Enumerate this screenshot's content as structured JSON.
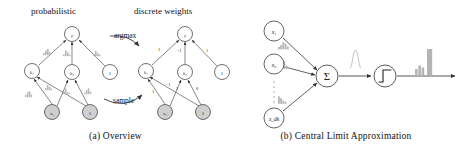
{
  "figure": {
    "panels": [
      {
        "id": "overview",
        "caption": "(a) Overview",
        "headings": {
          "left": "probabilistic",
          "right": "discrete weights"
        },
        "transition_labels": {
          "top": "argmax",
          "bottom": "sample"
        },
        "left_graph": {
          "nodes": [
            {
              "id": "top",
              "label": "y",
              "shaded": false,
              "cx": 72,
              "cy": 34,
              "r": 7.5
            },
            {
              "id": "mid-left",
              "label": "h₁",
              "shaded": false,
              "cx": 32,
              "cy": 71,
              "r": 7.5
            },
            {
              "id": "mid-center",
              "label": "h₂",
              "shaded": false,
              "cx": 72,
              "cy": 72,
              "r": 7.5
            },
            {
              "id": "mid-right",
              "label": "1",
              "shaded": false,
              "cx": 110,
              "cy": 72,
              "r": 7.5
            },
            {
              "id": "bottom-left",
              "label": "x₁",
              "shaded": true,
              "cx": 52,
              "cy": 112,
              "r": 7.5
            },
            {
              "id": "bottom-right",
              "label": "1",
              "shaded": true,
              "cx": 90,
              "cy": 112,
              "r": 7.5
            }
          ],
          "edge_labels": [
            "w₁",
            "θ₁₀",
            "θ₁₁",
            "θ₂₀",
            "θ₂₁",
            "θ₃₀",
            "θ₃₁"
          ],
          "edge_label_note": "probabilistic edge weights drawn as small gray distribution histograms"
        },
        "right_graph": {
          "nodes": [
            {
              "id": "top",
              "label": "y",
              "shaded": false,
              "cx": 185,
              "cy": 34,
              "r": 7.5
            },
            {
              "id": "mid-left",
              "label": "h₁",
              "shaded": false,
              "cx": 146,
              "cy": 71,
              "r": 7.5
            },
            {
              "id": "mid-center",
              "label": "h₂",
              "shaded": false,
              "cx": 185,
              "cy": 72,
              "r": 7.5
            },
            {
              "id": "mid-right",
              "label": "1",
              "shaded": false,
              "cx": 222,
              "cy": 72,
              "r": 7.5
            },
            {
              "id": "bottom-left",
              "label": "x₁",
              "shaded": true,
              "cx": 165,
              "cy": 112,
              "r": 7.5
            },
            {
              "id": "bottom-right",
              "label": "1",
              "shaded": true,
              "cx": 203,
              "cy": 112,
              "r": 7.5
            }
          ],
          "edge_weights": {
            "top_left": "1",
            "top_center": "−1",
            "top_right": "1",
            "lower_a": "1",
            "lower_b": "−1",
            "lower_c": "1",
            "lower_d": "0"
          }
        }
      },
      {
        "id": "central-limit",
        "caption": "(b) Central Limit Approximation",
        "input_nodes": [
          {
            "id": "x1",
            "label": "x₁",
            "cx": 274,
            "cy": 31,
            "r": 10
          },
          {
            "id": "x2",
            "label": "x₂",
            "cx": 274,
            "cy": 64,
            "r": 10
          },
          {
            "id": "xd",
            "label": "x_{dₖ}",
            "cx": 274,
            "cy": 118,
            "r": 10
          }
        ],
        "vertical_dots": "⋮",
        "sum_node": {
          "label": "Σ",
          "cx": 327,
          "cy": 76,
          "r": 11
        },
        "activation_node": {
          "label": "∫",
          "icon": "step-function-icon",
          "cx": 385,
          "cy": 76,
          "r": 11
        },
        "gaussian_label": "gaussian-bump",
        "edge_histograms": [
          "weight-dist-1",
          "weight-dist-2",
          "weight-dist-d"
        ],
        "output_histogram": "output-dist"
      }
    ]
  },
  "colors": {
    "ink": "#1a1a1a",
    "node_stroke": "#4a4a4a",
    "node_fill": "#ffffff",
    "node_shaded_fill": "#cfcfcf",
    "hist_fill": "#bdbdbd",
    "edge": "#555555",
    "background": "#ffffff"
  }
}
